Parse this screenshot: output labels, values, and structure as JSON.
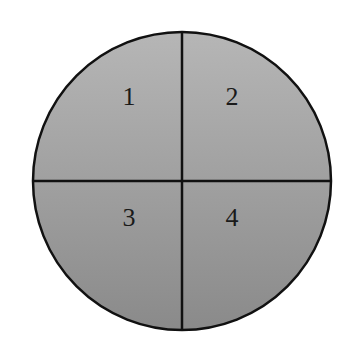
{
  "diagram": {
    "shape": "circle",
    "fill_top": "#b4b4b4",
    "fill_bottom": "#8c8c8c",
    "stroke": "#111111",
    "quadrants": [
      {
        "label": "1",
        "position": "top-left"
      },
      {
        "label": "2",
        "position": "top-right"
      },
      {
        "label": "3",
        "position": "bottom-left"
      },
      {
        "label": "4",
        "position": "bottom-right"
      }
    ]
  }
}
